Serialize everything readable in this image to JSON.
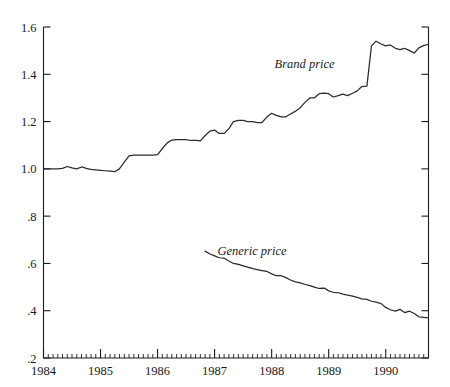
{
  "chart_data": {
    "type": "line",
    "title": "",
    "xlabel": "",
    "ylabel": "",
    "xlim": [
      1984.0,
      1990.75
    ],
    "ylim": [
      0.2,
      1.6
    ],
    "grid": false,
    "legend_position": "inline-annotation",
    "ytick_labels": [
      "1.6",
      "1.4",
      "1.2",
      "1.0",
      ".8",
      ".6",
      ".4",
      ".2"
    ],
    "ytick_values": [
      1.6,
      1.4,
      1.2,
      1.0,
      0.8,
      0.6,
      0.4,
      0.2
    ],
    "xtick_labels": [
      "1984",
      "1985",
      "1986",
      "1987",
      "1988",
      "1989",
      "1990"
    ],
    "xtick_values": [
      1984,
      1985,
      1986,
      1987,
      1988,
      1989,
      1990
    ],
    "minor_tick_interval_months": 1,
    "annotations": [
      {
        "text": "Brand price",
        "x": 1988.05,
        "y": 1.425
      },
      {
        "text": "Generic price",
        "x": 1987.05,
        "y": 0.635
      }
    ],
    "series": [
      {
        "name": "Brand price",
        "color": "#2b2b2b",
        "x": [
          1984.0,
          1984.08,
          1984.17,
          1984.25,
          1984.33,
          1984.42,
          1984.5,
          1984.58,
          1984.67,
          1984.75,
          1984.83,
          1984.92,
          1985.0,
          1985.08,
          1985.17,
          1985.25,
          1985.33,
          1985.42,
          1985.5,
          1985.58,
          1985.67,
          1985.75,
          1985.83,
          1985.92,
          1986.0,
          1986.08,
          1986.17,
          1986.25,
          1986.33,
          1986.42,
          1986.5,
          1986.58,
          1986.67,
          1986.75,
          1986.83,
          1986.92,
          1987.0,
          1987.08,
          1987.17,
          1987.25,
          1987.33,
          1987.42,
          1987.5,
          1987.58,
          1987.67,
          1987.75,
          1987.83,
          1987.92,
          1988.0,
          1988.08,
          1988.17,
          1988.25,
          1988.33,
          1988.42,
          1988.5,
          1988.58,
          1988.67,
          1988.75,
          1988.83,
          1988.92,
          1989.0,
          1989.08,
          1989.17,
          1989.25,
          1989.33,
          1989.42,
          1989.5,
          1989.58,
          1989.67,
          1989.75,
          1989.83,
          1989.92,
          1990.0,
          1990.08,
          1990.17,
          1990.25,
          1990.33,
          1990.42,
          1990.5,
          1990.58,
          1990.67,
          1990.75
        ],
        "values": [
          1.0,
          1.0,
          1.0,
          1.0,
          1.002,
          1.01,
          1.004,
          1.0,
          1.008,
          1.002,
          0.998,
          0.996,
          0.994,
          0.992,
          0.99,
          0.988,
          1.0,
          1.03,
          1.055,
          1.058,
          1.058,
          1.058,
          1.058,
          1.058,
          1.06,
          1.085,
          1.11,
          1.122,
          1.124,
          1.124,
          1.124,
          1.12,
          1.12,
          1.118,
          1.14,
          1.16,
          1.164,
          1.15,
          1.15,
          1.17,
          1.2,
          1.205,
          1.205,
          1.2,
          1.2,
          1.196,
          1.196,
          1.22,
          1.235,
          1.226,
          1.22,
          1.22,
          1.232,
          1.244,
          1.258,
          1.28,
          1.3,
          1.3,
          1.318,
          1.32,
          1.318,
          1.304,
          1.31,
          1.316,
          1.31,
          1.32,
          1.33,
          1.348,
          1.35,
          1.52,
          1.54,
          1.528,
          1.52,
          1.524,
          1.51,
          1.504,
          1.51,
          1.5,
          1.49,
          1.512,
          1.522,
          1.526
        ]
      },
      {
        "name": "Generic price",
        "color": "#2b2b2b",
        "x": [
          1986.83,
          1986.92,
          1987.0,
          1987.08,
          1987.17,
          1987.25,
          1987.33,
          1987.42,
          1987.5,
          1987.58,
          1987.67,
          1987.75,
          1987.83,
          1987.92,
          1988.0,
          1988.08,
          1988.17,
          1988.25,
          1988.33,
          1988.42,
          1988.5,
          1988.58,
          1988.67,
          1988.75,
          1988.83,
          1988.92,
          1989.0,
          1989.08,
          1989.17,
          1989.25,
          1989.33,
          1989.42,
          1989.5,
          1989.58,
          1989.67,
          1989.75,
          1989.83,
          1989.92,
          1990.0,
          1990.08,
          1990.17,
          1990.25,
          1990.33,
          1990.42,
          1990.5,
          1990.58,
          1990.67,
          1990.75
        ],
        "values": [
          0.652,
          0.64,
          0.632,
          0.624,
          0.622,
          0.61,
          0.6,
          0.596,
          0.59,
          0.584,
          0.578,
          0.574,
          0.57,
          0.566,
          0.556,
          0.548,
          0.548,
          0.54,
          0.53,
          0.522,
          0.518,
          0.512,
          0.506,
          0.5,
          0.494,
          0.496,
          0.484,
          0.478,
          0.476,
          0.47,
          0.466,
          0.462,
          0.456,
          0.45,
          0.448,
          0.44,
          0.436,
          0.43,
          0.414,
          0.404,
          0.398,
          0.406,
          0.392,
          0.398,
          0.388,
          0.374,
          0.372,
          0.37
        ]
      }
    ]
  }
}
